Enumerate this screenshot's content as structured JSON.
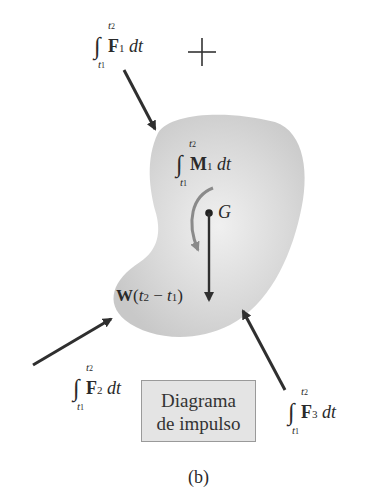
{
  "figure": {
    "caption": "(b)",
    "box_label_line1": "Diagrama",
    "box_label_line2": "de impulso",
    "center_label": "G",
    "weight_label": {
      "vec": "W",
      "text_open": "(",
      "t2": "t",
      "sub2": "2",
      "minus": " − ",
      "t1": "t",
      "sub1": "1",
      "text_close": ")"
    },
    "impulses": [
      {
        "id": "F1",
        "vec": "F",
        "sub": "1",
        "upper": "t2",
        "lower": "t1",
        "dt": "dt",
        "integral": "∫"
      },
      {
        "id": "M1",
        "vec": "M",
        "sub": "1",
        "upper": "t2",
        "lower": "t1",
        "dt": "dt",
        "integral": "∫"
      },
      {
        "id": "F2",
        "vec": "F",
        "sub": "2",
        "upper": "t2",
        "lower": "t1",
        "dt": "dt",
        "integral": "∫"
      },
      {
        "id": "F3",
        "vec": "F",
        "sub": "3",
        "upper": "t2",
        "lower": "t1",
        "dt": "dt",
        "integral": "∫"
      }
    ],
    "colors": {
      "body": "#d8d8d8",
      "arrow": "#2f2f2f",
      "moment_arrow": "#8a8a8a",
      "box": "#e4e4e4"
    }
  }
}
